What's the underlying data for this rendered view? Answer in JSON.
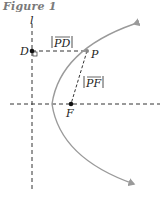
{
  "figure": {
    "title": "Figure 1",
    "labels": {
      "directrix": "l",
      "point_d": "D",
      "point_p": "P",
      "point_f": "F",
      "segment_pd": "PD",
      "segment_pf": "PF"
    },
    "colors": {
      "curve": "#9a9a9a",
      "dashed": "#333333",
      "points": "#111111",
      "title": "#7a7a7a"
    }
  }
}
